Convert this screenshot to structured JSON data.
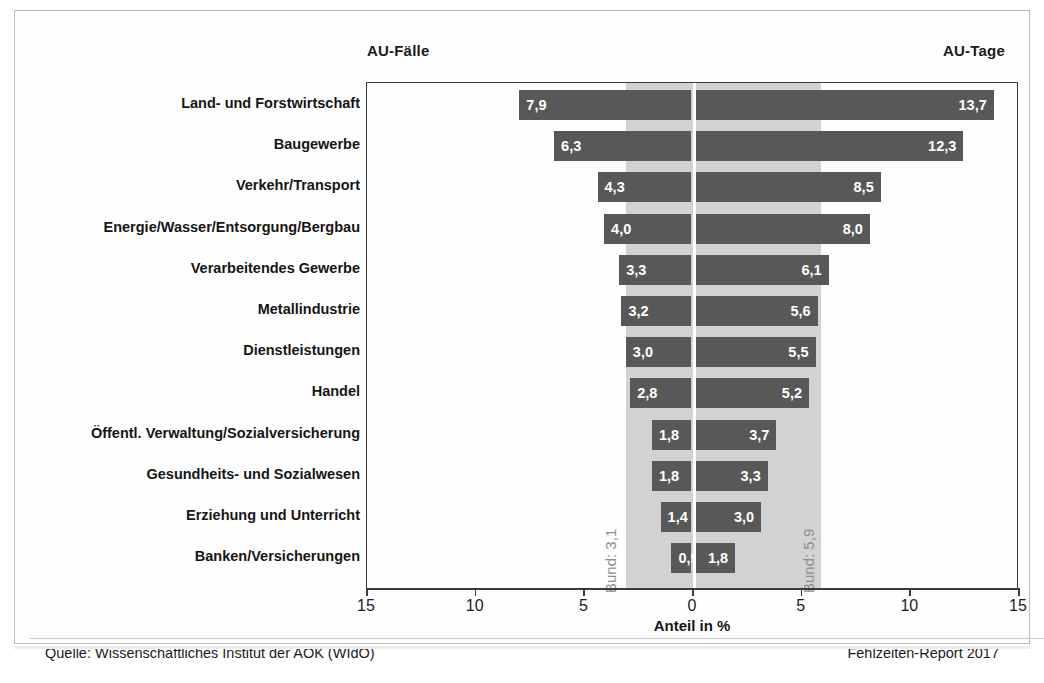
{
  "header": {
    "left_label": "AU-Fälle",
    "right_label": "AU-Tage"
  },
  "axis": {
    "title": "Anteil in %",
    "tick_labels": [
      "15",
      "10",
      "5",
      "0",
      "5",
      "10",
      "15"
    ]
  },
  "reference": {
    "left_caption": "Bund: 3,1",
    "right_caption": "Bund: 5,9"
  },
  "footer": {
    "source": "Quelle: Wissenschaftliches Institut der AOK (WIdO)",
    "report": "Fehlzeiten-Report 2017"
  },
  "colors": {
    "bar": "#585858",
    "band": "#d2d2d2",
    "axis": "#3a3a3a",
    "value_text": "#ffffff",
    "caption": "#8e8e8e"
  },
  "chart_data": {
    "type": "bar",
    "orientation": "horizontal-diverging",
    "title": "",
    "xlabel": "Anteil in %",
    "ylabel": "",
    "xlim": [
      -15,
      15
    ],
    "xticks": [
      -15,
      -10,
      -5,
      0,
      5,
      10,
      15
    ],
    "xtick_labels": [
      "15",
      "10",
      "5",
      "0",
      "5",
      "10",
      "15"
    ],
    "grid": false,
    "legend": "none",
    "categories": [
      "Land- und Forstwirtschaft",
      "Baugewerbe",
      "Verkehr/Transport",
      "Energie/Wasser/Entsorgung/Bergbau",
      "Verarbeitendes Gewerbe",
      "Metallindustrie",
      "Dienstleistungen",
      "Handel",
      "Öffentl. Verwaltung/Sozialversicherung",
      "Gesundheits- und Sozialwesen",
      "Erziehung und Unterricht",
      "Banken/Versicherungen"
    ],
    "series": [
      {
        "name": "AU-Fälle",
        "side": "left",
        "values": [
          7.9,
          6.3,
          4.3,
          4.0,
          3.3,
          3.2,
          3.0,
          2.8,
          1.8,
          1.8,
          1.4,
          0.9
        ],
        "labels": [
          "7,9",
          "6,3",
          "4,3",
          "4,0",
          "3,3",
          "3,2",
          "3,0",
          "2,8",
          "1,8",
          "1,8",
          "1,4",
          "0,9"
        ]
      },
      {
        "name": "AU-Tage",
        "side": "right",
        "values": [
          13.7,
          12.3,
          8.5,
          8.0,
          6.1,
          5.6,
          5.5,
          5.2,
          3.7,
          3.3,
          3.0,
          1.8
        ],
        "labels": [
          "13,7",
          "12,3",
          "8,5",
          "8,0",
          "6,1",
          "5,6",
          "5,5",
          "5,2",
          "3,7",
          "3,3",
          "3,0",
          "1,8"
        ]
      }
    ],
    "reference_lines": [
      {
        "name": "Bund AU-Fälle",
        "side": "left",
        "value": 3.1,
        "label": "Bund: 3,1"
      },
      {
        "name": "Bund AU-Tage",
        "side": "right",
        "value": 5.9,
        "label": "Bund: 5,9"
      }
    ],
    "annotations": [
      "Quelle: Wissenschaftliches Institut der AOK (WIdO)",
      "Fehlzeiten-Report 2017"
    ]
  }
}
